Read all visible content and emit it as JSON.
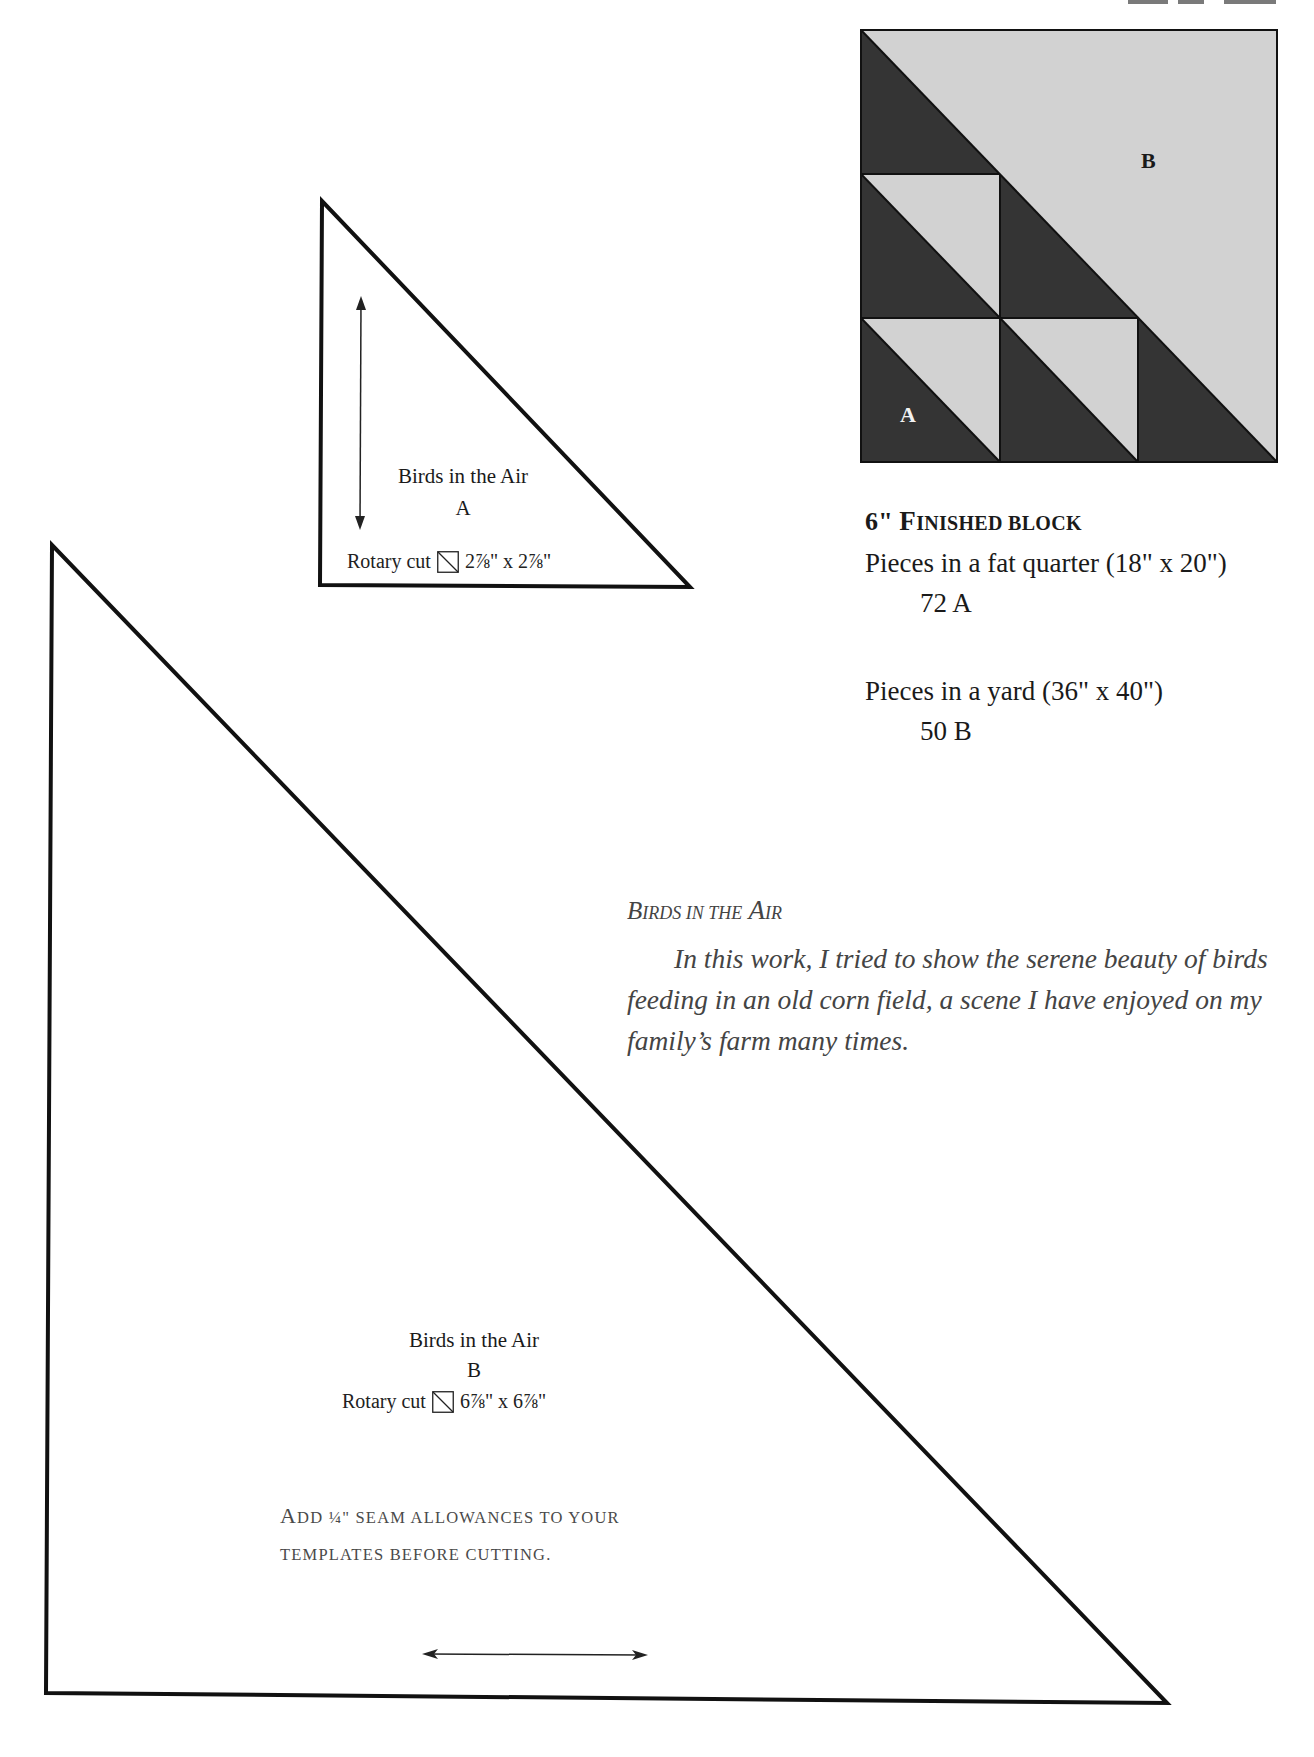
{
  "page": {
    "title_fragment_visible": true
  },
  "block_diagram": {
    "colors": {
      "dark": "#343434",
      "light": "#d2d2d2",
      "outline": "#111111"
    },
    "grid": 3,
    "labels": [
      {
        "text": "B",
        "color": "#1a1a1a"
      },
      {
        "text": "A",
        "color": "#f2f2f2"
      }
    ]
  },
  "template_a": {
    "name": "Birds in the Air",
    "letter": "A",
    "rotary_prefix": "Rotary cut",
    "rotary_icon": "half-square-triangle-icon",
    "rotary_size": "2⅞\" x 2⅞\"",
    "grain_arrow": "vertical-double-arrow"
  },
  "template_b": {
    "name": "Birds in the Air",
    "letter": "B",
    "rotary_prefix": "Rotary cut",
    "rotary_icon": "half-square-triangle-icon",
    "rotary_size": "6⅞\" x 6⅞\"",
    "grain_arrow": "horizontal-double-arrow"
  },
  "block_info": {
    "finished_size": "6\"",
    "finished_first_cap": "F",
    "finished_rest": "inished block",
    "fat_quarter_line": "Pieces in a fat quarter (18\" x 20\")",
    "fat_quarter_count": "72 A",
    "yard_line": "Pieces in a yard (36\" x 40\")",
    "yard_count": "50 B"
  },
  "essay": {
    "heading_cap_1": "B",
    "heading_rest_1": "irds in the",
    "heading_cap_2": "A",
    "heading_rest_2": "ir",
    "body": "In this work, I tried to show the serene beauty of birds feeding in an old corn field, a scene I have enjoyed on my family’s farm many times."
  },
  "seam_note": {
    "line1_cap": "A",
    "line1_rest": "dd ¼\" seam allowances to your",
    "line2": "templates before cutting."
  }
}
